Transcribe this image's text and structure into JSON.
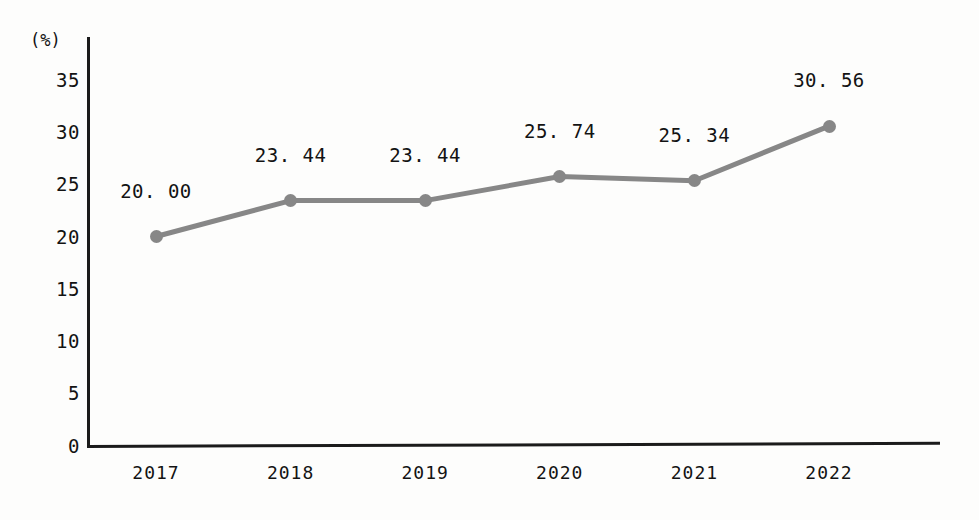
{
  "chart_data": {
    "type": "line",
    "title": "",
    "xlabel": "",
    "ylabel": "(%)",
    "unit_label": "(%)",
    "categories": [
      "2017",
      "2018",
      "2019",
      "2020",
      "2021",
      "2022"
    ],
    "values": [
      20.0,
      23.44,
      23.44,
      25.74,
      25.34,
      30.56
    ],
    "point_labels": [
      "20. 00",
      "23. 44",
      "23. 44",
      "25. 74",
      "25. 34",
      "30. 56"
    ],
    "ylim": [
      0,
      35
    ],
    "ytick_labels": [
      "0",
      "5",
      "10",
      "15",
      "20",
      "25",
      "30",
      "35"
    ],
    "ytick_values": [
      0,
      5,
      10,
      15,
      20,
      25,
      30,
      35
    ],
    "grid": false,
    "legend": null,
    "series": [
      {
        "name": "",
        "values": [
          20.0,
          23.44,
          23.44,
          25.74,
          25.34,
          30.56
        ],
        "color": "#878787",
        "marker": "circle"
      }
    ],
    "colors": {
      "series": "#878787",
      "axis": "#1b1b1b",
      "text": "#131313",
      "background": "#fdfdfc"
    }
  }
}
